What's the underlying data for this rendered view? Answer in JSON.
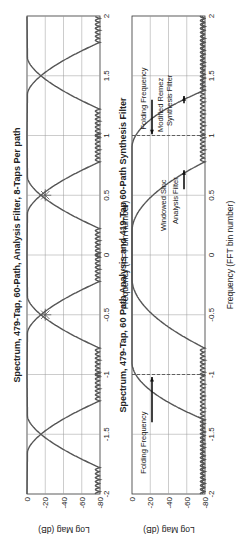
{
  "chart_data": [
    {
      "type": "line",
      "title": "Spectrum, 479-Tap, 60-Path, Analysis Filter, 8-Taps Per path",
      "xlabel": "Frequency (FFT bin number)",
      "ylabel": "Log Mag (dB)",
      "xlim": [
        -2,
        2
      ],
      "ylim": [
        -80,
        0
      ],
      "xticks": [
        "-2",
        "-1.5",
        "-1",
        "-0.5",
        "0",
        "0.5",
        "1",
        "1.5",
        "2"
      ],
      "yticks": [
        "0",
        "-20",
        "-40",
        "-60",
        "-80"
      ],
      "grid": true,
      "series": [
        {
          "name": "Analysis filter centered at bin -1",
          "center": -1,
          "passband_edge": 0.5,
          "stopband_level_db": -80
        },
        {
          "name": "Analysis filter centered at bin 0",
          "center": 0,
          "passband_edge": 0.5,
          "stopband_level_db": -80
        },
        {
          "name": "Analysis filter centered at bin 1",
          "center": 1,
          "passband_edge": 0.5,
          "stopband_level_db": -80
        }
      ],
      "markers": [
        {
          "x": -0.5,
          "y_db": -6,
          "shape": "asterisk"
        },
        {
          "x": 0.5,
          "y_db": -6,
          "shape": "asterisk"
        }
      ]
    },
    {
      "type": "line",
      "title": "Spectrum, 479-Tap, 60 Path Analysis and 419-Tap 60-Path Synthesis Filter",
      "xlabel": "Frequency (FFT bin number)",
      "ylabel": "Log Mag (dB)",
      "xlim": [
        -2,
        2
      ],
      "ylim": [
        -80,
        0
      ],
      "xticks": [
        "-2",
        "-1.5",
        "-1",
        "-0.5",
        "0",
        "0.5",
        "1",
        "1.5",
        "2"
      ],
      "yticks": [
        "0",
        "-20",
        "-40",
        "-60",
        "-80"
      ],
      "grid": true,
      "series": [
        {
          "name": "Windowed Sinc Analysis Filter",
          "passband": [
            -0.5,
            0.5
          ],
          "stopband_start": 0.75,
          "stopband_level_db": -80
        },
        {
          "name": "Modified Remez Synthesis Filter",
          "passband": [
            -1,
            1
          ],
          "stopband_start": 1.4,
          "stopband_level_db": -80
        }
      ],
      "vlines": [
        {
          "x": -1,
          "style": "dashed"
        },
        {
          "x": 1,
          "style": "dashed"
        }
      ],
      "annotations": [
        {
          "text": "Folding Frequency",
          "x": 1,
          "side": "upper"
        },
        {
          "text": "Modified Remez Synthesis Filter",
          "x": 1.4
        },
        {
          "text": "Windowed Sinc Analysis Filter",
          "x": 0.6
        },
        {
          "text": "Folding Frequency",
          "x": -1,
          "side": "lower"
        }
      ]
    }
  ],
  "labels": {
    "title1": "Spectrum, 479-Tap, 60-Path, Analysis Filter, 8-Taps Per path",
    "title2": "Spectrum, 479-Tap, 60 Path Analysis and 419-Tap 60-Path Synthesis Filter",
    "xlabel": "Frequency (FFT bin number)",
    "ylabel": "Log Mag (dB)",
    "ann_fold": "Folding Frequency",
    "ann_remez_1": "Modified Remez",
    "ann_remez_2": "Synthesis Filter",
    "ann_sinc_1": "Windowed Sinc",
    "ann_sinc_2": "Analysis Filter",
    "x_ticks": [
      "-2",
      "-1.5",
      "-1",
      "-0.5",
      "0",
      "0.5",
      "1",
      "1.5",
      "2"
    ],
    "y_ticks": [
      "0",
      "-20",
      "-40",
      "-60",
      "-80"
    ]
  }
}
